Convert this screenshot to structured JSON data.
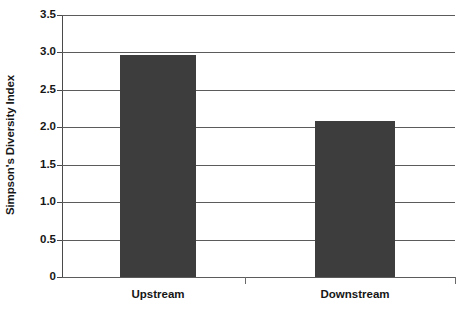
{
  "chart_data": {
    "type": "bar",
    "title": "",
    "xlabel": "",
    "ylabel": "Simpson's Diversity Index",
    "categories": [
      "Upstream",
      "Downstream"
    ],
    "values": [
      2.97,
      2.09
    ],
    "series": [
      {
        "name": "Simpson's Diversity Index",
        "values": [
          2.97,
          2.09
        ]
      }
    ],
    "ylim": [
      0,
      3.5
    ],
    "ytick_labels": [
      "3.5",
      "3.0",
      "2.5",
      "2.0",
      "1.5",
      "1.0",
      "0.5",
      "0"
    ],
    "ytick_values": [
      3.5,
      3.0,
      2.5,
      2.0,
      1.5,
      1.0,
      0.5,
      0
    ],
    "grid": true,
    "legend": false,
    "legend_position": "none",
    "bar_color": "#3d3d3d",
    "gridline_color": "#5b5b5b",
    "axis_color": "#3c3c3c",
    "background_color": "#ffffff"
  }
}
